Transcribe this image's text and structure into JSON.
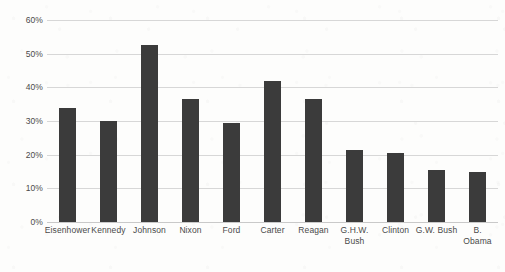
{
  "chart_data": {
    "type": "bar",
    "title": "",
    "subtitle": "",
    "xlabel": "",
    "ylabel": "",
    "categories": [
      "Eisenhower",
      "Kennedy",
      "Johnson",
      "Nixon",
      "Ford",
      "Carter",
      "Reagan",
      "G.H.W.\nBush",
      "Clinton",
      "G.W. Bush",
      "B. Obama"
    ],
    "values": [
      34,
      30,
      52.5,
      36.5,
      29.5,
      42,
      36.5,
      21.5,
      20.5,
      15.5,
      15
    ],
    "ylim": [
      0,
      60
    ],
    "yticks": [
      0,
      10,
      20,
      30,
      40,
      50,
      60
    ],
    "ytick_labels": [
      "0%",
      "10%",
      "20%",
      "30%",
      "40%",
      "50%",
      "60%"
    ],
    "grid": true,
    "legend": "none",
    "bar_color": "#3b3b3b",
    "gridline_color": "#d7d7d7",
    "background_color": "#fdfdfc"
  }
}
